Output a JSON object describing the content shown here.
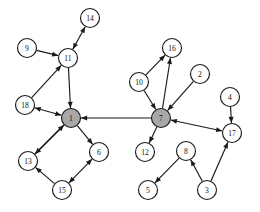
{
  "diagram": {
    "type": "directed-graph",
    "title": "",
    "background_color": "#ffffff",
    "edge_color": "#1a1a1a",
    "node_stroke_color": "#1a1a1a",
    "node_fill_default": "#ffffff",
    "node_fill_highlight": "#a8a8a8",
    "node_radius": 9.5,
    "highlighted_nodes": [
      "1",
      "7"
    ],
    "nodes": [
      {
        "id": "14",
        "label": "14",
        "x": 90,
        "y": 18,
        "highlight": false
      },
      {
        "id": "9",
        "label": "9",
        "x": 27,
        "y": 48,
        "highlight": false
      },
      {
        "id": "11",
        "label": "11",
        "x": 68,
        "y": 58,
        "highlight": false
      },
      {
        "id": "16",
        "label": "16",
        "x": 172,
        "y": 48,
        "highlight": false
      },
      {
        "id": "2",
        "label": "2",
        "x": 200,
        "y": 74,
        "highlight": false
      },
      {
        "id": "10",
        "label": "10",
        "x": 139,
        "y": 82,
        "highlight": false
      },
      {
        "id": "18",
        "label": "18",
        "x": 25,
        "y": 105,
        "highlight": false
      },
      {
        "id": "4",
        "label": "4",
        "x": 230,
        "y": 97,
        "highlight": false
      },
      {
        "id": "1",
        "label": "1",
        "x": 71,
        "y": 118,
        "highlight": true
      },
      {
        "id": "7",
        "label": "7",
        "x": 161,
        "y": 118,
        "highlight": true
      },
      {
        "id": "17",
        "label": "17",
        "x": 232,
        "y": 133,
        "highlight": false
      },
      {
        "id": "6",
        "label": "6",
        "x": 99,
        "y": 152,
        "highlight": false
      },
      {
        "id": "13",
        "label": "13",
        "x": 28,
        "y": 161,
        "highlight": false
      },
      {
        "id": "12",
        "label": "12",
        "x": 145,
        "y": 152,
        "highlight": false
      },
      {
        "id": "8",
        "label": "8",
        "x": 186,
        "y": 151,
        "highlight": false
      },
      {
        "id": "15",
        "label": "15",
        "x": 62,
        "y": 190,
        "highlight": false
      },
      {
        "id": "5",
        "label": "5",
        "x": 148,
        "y": 190,
        "highlight": false
      },
      {
        "id": "3",
        "label": "3",
        "x": 207,
        "y": 190,
        "highlight": false
      }
    ],
    "edges": [
      {
        "from": "11",
        "to": "14",
        "direction": "both"
      },
      {
        "from": "9",
        "to": "11",
        "direction": "forward"
      },
      {
        "from": "11",
        "to": "1",
        "direction": "forward"
      },
      {
        "from": "18",
        "to": "11",
        "direction": "forward"
      },
      {
        "from": "1",
        "to": "18",
        "direction": "both"
      },
      {
        "from": "7",
        "to": "1",
        "direction": "forward"
      },
      {
        "from": "1",
        "to": "13",
        "direction": "forward"
      },
      {
        "from": "13",
        "to": "1",
        "direction": "forward"
      },
      {
        "from": "1",
        "to": "6",
        "direction": "forward"
      },
      {
        "from": "15",
        "to": "13",
        "direction": "forward"
      },
      {
        "from": "15",
        "to": "6",
        "direction": "both"
      },
      {
        "from": "10",
        "to": "16",
        "direction": "forward"
      },
      {
        "from": "7",
        "to": "16",
        "direction": "forward"
      },
      {
        "from": "10",
        "to": "7",
        "direction": "forward"
      },
      {
        "from": "2",
        "to": "7",
        "direction": "forward"
      },
      {
        "from": "7",
        "to": "12",
        "direction": "forward"
      },
      {
        "from": "7",
        "to": "17",
        "direction": "both"
      },
      {
        "from": "4",
        "to": "17",
        "direction": "forward"
      },
      {
        "from": "3",
        "to": "17",
        "direction": "forward"
      },
      {
        "from": "8",
        "to": "5",
        "direction": "forward"
      },
      {
        "from": "3",
        "to": "8",
        "direction": "forward"
      }
    ]
  }
}
